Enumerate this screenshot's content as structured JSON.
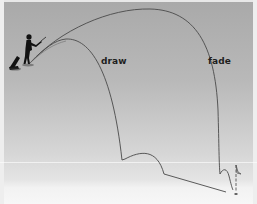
{
  "diagram": {
    "labels": {
      "draw": "draw",
      "fade": "fade"
    },
    "elements": {
      "golfer": "golfer-silhouette",
      "bag": "golf-bag",
      "flag": "flag-pin",
      "hole": "hole"
    },
    "colors": {
      "background_top": "#a9a9a9",
      "background_bottom": "#f7f7f7",
      "trajectory_line": "#4a4a4a",
      "label_text": "#1e1e1e",
      "silhouette": "#111111"
    }
  }
}
